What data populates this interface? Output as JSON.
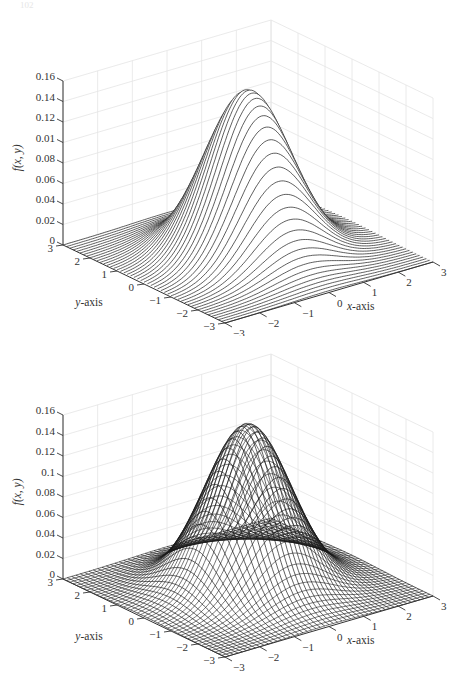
{
  "page": {
    "number": "102"
  },
  "chart_data": [
    {
      "type": "surface",
      "title": "",
      "description": "3D surface of bivariate standard normal density, rendered as x-direction mesh lines only (waterfall style)",
      "function": "f(x,y) = exp(-(x^2+y^2)/2) / (2*pi)",
      "mesh_style": "row-lines",
      "xlabel": "x-axis",
      "ylabel": "y-axis",
      "zlabel": "f(x, y)",
      "xlim": [
        -3,
        3
      ],
      "ylim": [
        -3,
        3
      ],
      "zlim": [
        0,
        0.16
      ],
      "x_ticks": [
        "-3",
        "-2",
        "-1",
        "0",
        "1",
        "2",
        "3"
      ],
      "y_ticks": [
        "-3",
        "-2",
        "-1",
        "0",
        "1",
        "2",
        "3"
      ],
      "z_ticks": [
        "0",
        "0.02",
        "0.04",
        "0.06",
        "0.08",
        "0.01",
        "0.12",
        "0.14",
        "0.16"
      ],
      "peak": {
        "x": 0,
        "y": 0,
        "z": 0.159
      },
      "grid": true
    },
    {
      "type": "surface",
      "title": "",
      "description": "3D wire-mesh surface of bivariate standard normal density",
      "function": "f(x,y) = exp(-(x^2+y^2)/2) / (2*pi)",
      "mesh_style": "full-mesh",
      "xlabel": "x-axis",
      "ylabel": "y-axis",
      "zlabel": "f(x, y)",
      "xlim": [
        -3,
        3
      ],
      "ylim": [
        -3,
        3
      ],
      "zlim": [
        0,
        0.16
      ],
      "x_ticks": [
        "-3",
        "-2",
        "-1",
        "0",
        "1",
        "2",
        "3"
      ],
      "y_ticks": [
        "-3",
        "-2",
        "-1",
        "0",
        "1",
        "2",
        "3"
      ],
      "z_ticks": [
        "0",
        "0.02",
        "0.04",
        "0.06",
        "0.08",
        "0.1",
        "0.12",
        "0.14",
        "0.16"
      ],
      "peak": {
        "x": 0,
        "y": 0,
        "z": 0.159
      },
      "grid": true
    }
  ],
  "colors": {
    "line": "#1a1a1a",
    "grid": "#e4e4e4",
    "axis": "#333333"
  }
}
